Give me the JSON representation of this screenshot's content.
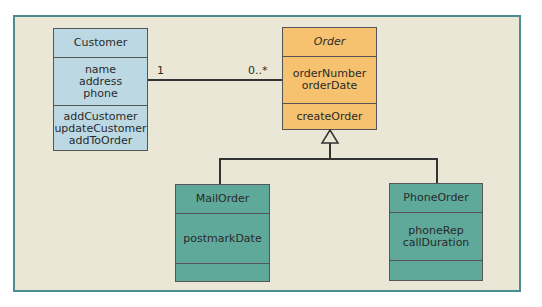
{
  "diagram": {
    "type": "UML class diagram",
    "colors": {
      "background": "#ebe7d6",
      "frame_border": "#4c8c93",
      "customer_fill": "#bcd9e3",
      "order_fill": "#f6c26f",
      "subclass_fill": "#5fa99b"
    },
    "classes": {
      "customer": {
        "name": "Customer",
        "attributes": [
          "name",
          "address",
          "phone"
        ],
        "operations": [
          "addCustomer",
          "updateCustomer",
          "addToOrder"
        ]
      },
      "order": {
        "name": "Order",
        "abstract": true,
        "attributes": [
          "orderNumber",
          "orderDate"
        ],
        "operations": [
          "createOrder"
        ]
      },
      "mail_order": {
        "name": "MailOrder",
        "attributes": [
          "postmarkDate"
        ],
        "operations": []
      },
      "phone_order": {
        "name": "PhoneOrder",
        "attributes": [
          "phoneRep",
          "callDuration"
        ],
        "operations": []
      }
    },
    "association": {
      "from": "Customer",
      "to": "Order",
      "from_multiplicity": "1",
      "to_multiplicity": "0..*"
    },
    "generalization": {
      "parent": "Order",
      "children": [
        "MailOrder",
        "PhoneOrder"
      ]
    }
  }
}
